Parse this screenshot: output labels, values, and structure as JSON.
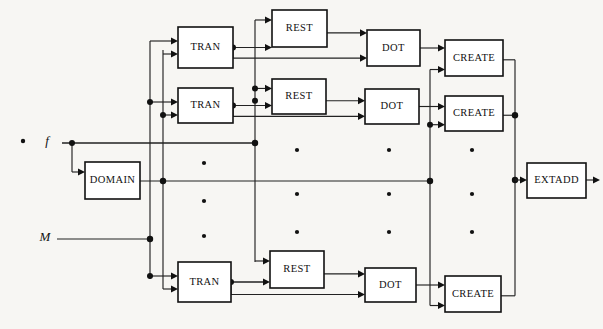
{
  "diagram": {
    "type": "block-diagram",
    "canvas": {
      "width": 603,
      "height": 329
    },
    "colors": {
      "background": "#f7f6f3",
      "box_fill": "#ffffff",
      "stroke": "#111111",
      "wire": "#222222",
      "text": "#111111"
    },
    "inputs": [
      {
        "id": "f",
        "label": "f",
        "x": 47,
        "y": 142,
        "bullet": true,
        "bullet_x": 23,
        "bullet_y": 141
      },
      {
        "id": "M",
        "label": "M",
        "x": 45,
        "y": 238,
        "bullet": false
      }
    ],
    "blocks": [
      {
        "id": "tran-1",
        "label": "TRAN",
        "x": 178,
        "y": 27,
        "w": 55,
        "h": 41,
        "row": 1,
        "col": "tran"
      },
      {
        "id": "tran-2",
        "label": "TRAN",
        "x": 178,
        "y": 88,
        "w": 55,
        "h": 35,
        "row": 2,
        "col": "tran"
      },
      {
        "id": "tran-n",
        "label": "TRAN",
        "x": 178,
        "y": 262,
        "w": 53,
        "h": 40,
        "row": 3,
        "col": "tran"
      },
      {
        "id": "rest-1",
        "label": "REST",
        "x": 272,
        "y": 10,
        "w": 55,
        "h": 37,
        "row": 1,
        "col": "rest"
      },
      {
        "id": "rest-2",
        "label": "REST",
        "x": 272,
        "y": 79,
        "w": 54,
        "h": 35,
        "row": 2,
        "col": "rest"
      },
      {
        "id": "rest-n",
        "label": "REST",
        "x": 270,
        "y": 251,
        "w": 54,
        "h": 37,
        "row": 3,
        "col": "rest"
      },
      {
        "id": "dot-1",
        "label": "DOT",
        "x": 367,
        "y": 30,
        "w": 53,
        "h": 36,
        "row": 1,
        "col": "dot"
      },
      {
        "id": "dot-2",
        "label": "DOT",
        "x": 365,
        "y": 89,
        "w": 54,
        "h": 35,
        "row": 2,
        "col": "dot"
      },
      {
        "id": "dot-n",
        "label": "DOT",
        "x": 365,
        "y": 268,
        "w": 51,
        "h": 34,
        "row": 3,
        "col": "dot"
      },
      {
        "id": "create-1",
        "label": "CREATE",
        "x": 445,
        "y": 40,
        "w": 58,
        "h": 36,
        "row": 1,
        "col": "create"
      },
      {
        "id": "create-2",
        "label": "CREATE",
        "x": 445,
        "y": 96,
        "w": 58,
        "h": 35,
        "row": 2,
        "col": "create"
      },
      {
        "id": "create-n",
        "label": "CREATE",
        "x": 445,
        "y": 276,
        "w": 56,
        "h": 36,
        "row": 3,
        "col": "create"
      },
      {
        "id": "domain",
        "label": "DOMAIN",
        "x": 85,
        "y": 162,
        "w": 55,
        "h": 37,
        "row": 0,
        "col": "domain"
      },
      {
        "id": "extadd",
        "label": "EXTADD",
        "x": 527,
        "y": 163,
        "w": 59,
        "h": 35,
        "row": 0,
        "col": "extadd"
      }
    ],
    "ellipsis_columns": [
      {
        "id": "ellipsis-tran",
        "x": 204,
        "ys": [
          163,
          201,
          236
        ]
      },
      {
        "id": "ellipsis-rest",
        "x": 297,
        "ys": [
          150,
          194,
          232
        ]
      },
      {
        "id": "ellipsis-dot",
        "x": 389,
        "ys": [
          150,
          194,
          232
        ]
      },
      {
        "id": "ellipsis-create",
        "x": 472,
        "ys": [
          150,
          194,
          232
        ]
      }
    ],
    "buses": [
      {
        "id": "bus-f",
        "x": 72,
        "label": "f input bus"
      },
      {
        "id": "bus-m",
        "x": 150,
        "label": "M input bus"
      },
      {
        "id": "bus-tran",
        "x": 163,
        "label": "TRAN feed bus"
      },
      {
        "id": "bus-restin",
        "x": 255,
        "label": "REST feed bus"
      },
      {
        "id": "bus-crin",
        "x": 430,
        "label": "CREATE feed bus"
      },
      {
        "id": "bus-crout",
        "x": 515,
        "label": "CREATE output bus"
      }
    ],
    "junction_dots": [
      {
        "x": 72,
        "y": 143
      },
      {
        "x": 150,
        "y": 239
      },
      {
        "x": 150,
        "y": 96
      },
      {
        "x": 163,
        "y": 105
      },
      {
        "x": 255,
        "y": 143
      },
      {
        "x": 255,
        "y": 88
      },
      {
        "x": 255,
        "y": 96
      },
      {
        "x": 233,
        "y": 41
      },
      {
        "x": 233,
        "y": 97
      },
      {
        "x": 231,
        "y": 276
      },
      {
        "x": 163,
        "y": 182
      },
      {
        "x": 430,
        "y": 182
      },
      {
        "x": 430,
        "y": 110
      },
      {
        "x": 515,
        "y": 113
      },
      {
        "x": 515,
        "y": 180
      }
    ],
    "output": {
      "id": "extadd-output",
      "label": "",
      "x": 586,
      "y": 180
    }
  }
}
